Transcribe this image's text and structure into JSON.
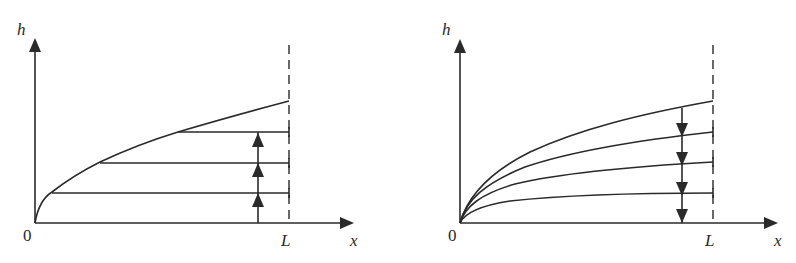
{
  "colors": {
    "stroke": "#2a2a2a",
    "background": "#ffffff"
  },
  "diagrams": [
    {
      "id": "left",
      "description": "Rising h profile: horizontal levels filling up, arrows pointing upward",
      "axis_labels": {
        "y": "h",
        "x": "x",
        "origin": "0",
        "boundary": "L"
      },
      "arrow_direction": "up",
      "curve_count": 1,
      "horizontal_level_count": 3,
      "arrowhead_count": 3
    },
    {
      "id": "right",
      "description": "Family of sqrt-like curves decreasing in height, arrows pointing downward",
      "axis_labels": {
        "y": "h",
        "x": "x",
        "origin": "0",
        "boundary": "L"
      },
      "arrow_direction": "down",
      "curve_count": 4,
      "arrowhead_count": 4
    }
  ]
}
